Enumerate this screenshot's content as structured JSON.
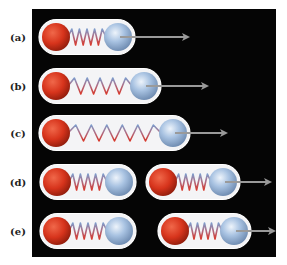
{
  "figure": {
    "panel_color": "#050505",
    "capsule_color": "#f4f4f6",
    "red_ball_color": "#d7341c",
    "blue_ball_color": "#9fbbdc",
    "arrow_color": "#9a9a9a",
    "rows": [
      {
        "label": "(a)",
        "y": 37,
        "molecules": [
          {
            "x1": 39,
            "x2": 135,
            "coils": 5,
            "arrow_end": 190
          }
        ]
      },
      {
        "label": "(b)",
        "y": 86,
        "molecules": [
          {
            "x1": 39,
            "x2": 161,
            "coils": 5,
            "arrow_end": 209
          }
        ]
      },
      {
        "label": "(c)",
        "y": 133,
        "molecules": [
          {
            "x1": 39,
            "x2": 190,
            "coils": 6,
            "arrow_end": 228
          }
        ]
      },
      {
        "label": "(d)",
        "y": 182,
        "molecules": [
          {
            "x1": 40,
            "x2": 136,
            "coils": 5,
            "arrow_end": null
          },
          {
            "x1": 146,
            "x2": 240,
            "coils": 5,
            "arrow_end": 272
          }
        ]
      },
      {
        "label": "(e)",
        "y": 231,
        "molecules": [
          {
            "x1": 40,
            "x2": 136,
            "coils": 5,
            "arrow_end": null
          },
          {
            "x1": 158,
            "x2": 251,
            "coils": 5,
            "arrow_end": 276
          }
        ]
      }
    ]
  }
}
